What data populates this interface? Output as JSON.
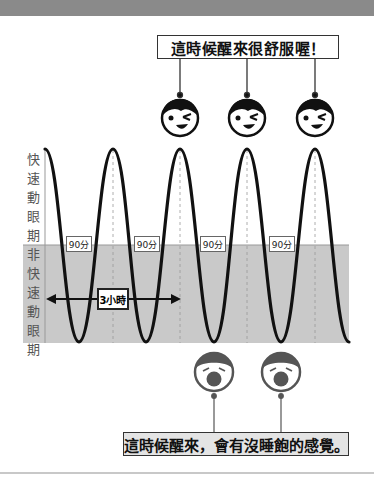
{
  "title_band": "",
  "callouts": {
    "top": "這時候醒來很舒服喔！",
    "bottom": "這時候醒來，會有沒睡飽的感覺。"
  },
  "axis_labels": {
    "rem": "快速動眼期",
    "nrem": "非快速動眼期"
  },
  "cycle_labels": [
    "90分",
    "90分",
    "90分",
    "90分"
  ],
  "span_label": "3小時",
  "icons": {
    "happy_faces": [
      "happy-wink-face-icon",
      "happy-wink-face-icon",
      "happy-wink-face-icon"
    ],
    "tired_faces": [
      "yawning-face-icon",
      "yawning-face-icon"
    ]
  },
  "colors": {
    "nrem_band": "#c9c9c9",
    "curve": "#111111",
    "header_band": "#8a8a8a"
  },
  "diagram": {
    "type": "sleep-cycle wave",
    "cycle_minutes": 90,
    "cycles_shown": 4.5,
    "rem_peaks_x": [
      45,
      113,
      180,
      247,
      315
    ],
    "nrem_troughs_x": [
      79,
      146,
      214,
      281,
      349
    ],
    "good_wake_points": "REM peaks at cycles 3, 4, 5",
    "bad_wake_points": "NREM troughs at cycles 3, 4"
  }
}
